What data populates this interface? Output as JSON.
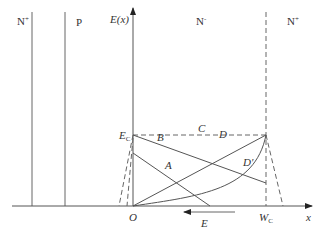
{
  "diagram": {
    "regions": [
      {
        "name": "N",
        "sup": "+"
      },
      {
        "name": "P",
        "sup": ""
      },
      {
        "name": "N",
        "sup": "-"
      },
      {
        "name": "N",
        "sup": "+"
      }
    ],
    "axes": {
      "y_label": "E(x)",
      "x_label": "x",
      "origin_label": "O",
      "ec_label_main": "E",
      "ec_label_sub": "C",
      "wc_label_main": "W",
      "wc_label_sub": "C"
    },
    "curve_labels": {
      "A": "A",
      "B": "B",
      "C": "C",
      "D": "D",
      "D_prime": "D'"
    },
    "field_arrow_label": "E",
    "colors": {
      "line": "#555555",
      "text": "#333333",
      "background": "#ffffff"
    }
  }
}
